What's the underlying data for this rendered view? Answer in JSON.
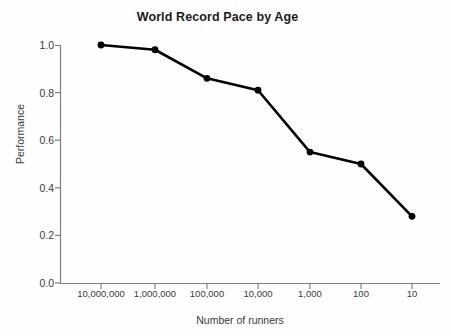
{
  "chart_data": {
    "type": "line",
    "title": "World Record Pace by Age",
    "xlabel": "Number of runners",
    "ylabel": "Performance",
    "categories": [
      "10,000,000",
      "1,000,000",
      "100,000",
      "10,000",
      "1,000",
      "100",
      "10"
    ],
    "values": [
      1.0,
      0.98,
      0.86,
      0.81,
      0.55,
      0.5,
      0.28
    ],
    "ylim": [
      0.0,
      1.0
    ],
    "yticks": [
      "0.0",
      "0.2",
      "0.4",
      "0.6",
      "0.8",
      "1.0"
    ],
    "ytick_values": [
      0.0,
      0.2,
      0.4,
      0.6,
      0.8,
      1.0
    ],
    "grid": false,
    "legend": "none",
    "series_color": "#000000",
    "marker": "circle",
    "axis_color": "#808080",
    "background": "#fefefe"
  }
}
